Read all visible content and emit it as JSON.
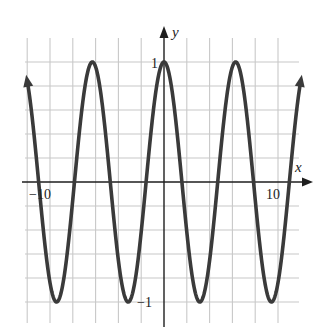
{
  "chart_data": {
    "type": "line",
    "title": "",
    "function": "y = cos(x)",
    "xlabel": "x",
    "ylabel": "y",
    "x_tick_labels": [
      {
        "value": -10,
        "label": "−10"
      },
      {
        "value": 10,
        "label": "10"
      }
    ],
    "y_tick_labels": [
      {
        "value": 1,
        "label": "1"
      },
      {
        "value": -1,
        "label": "−1"
      }
    ],
    "xlim": [
      -12.2,
      11.9
    ],
    "ylim": [
      -1.1,
      1.2
    ],
    "grid": true,
    "grid_x_step": 2,
    "grid_y_step": 0.2,
    "curve_domain": [
      -12.0,
      12.0
    ],
    "arrows_on_curve_ends": true,
    "series": [
      {
        "name": "cos(x)",
        "x": [
          -12,
          -9.42,
          -6.28,
          -3.14,
          0,
          3.14,
          6.28,
          9.42,
          12
        ],
        "values": [
          0.84,
          -1,
          1,
          -1,
          1,
          -1,
          1,
          -1,
          0.84
        ]
      }
    ],
    "legend": null,
    "colors": {
      "curve": "#3a3a3a",
      "grid": "#c8c8c8",
      "axis": "#1e1e1e"
    }
  }
}
